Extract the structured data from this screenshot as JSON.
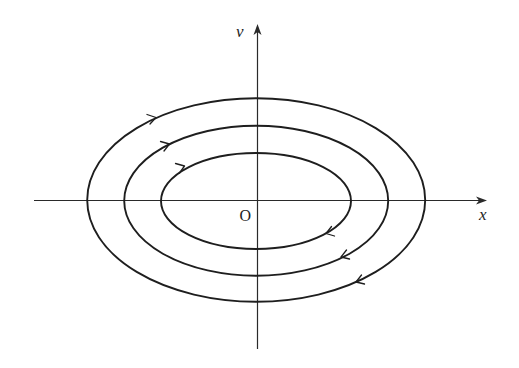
{
  "figure": {
    "type": "phase-portrait",
    "axes": {
      "horizontal": {
        "label": "x",
        "from": [
          34,
          200
        ],
        "to": [
          487,
          200
        ]
      },
      "vertical": {
        "label": "v",
        "from": [
          257,
          349
        ],
        "to": [
          257,
          24
        ]
      }
    },
    "origin_label": "O",
    "trajectory_direction": "clockwise",
    "colors": {
      "stroke": "#1e1e1e",
      "background": "#ffffff"
    },
    "trajectories": [
      {
        "name": "inner",
        "cx": 256,
        "cy": 201,
        "rx": 95,
        "ry": 48,
        "arrows": [
          {
            "x": 183,
            "y": 166,
            "dir": "up-right"
          },
          {
            "x": 327,
            "y": 233,
            "dir": "down-left"
          }
        ]
      },
      {
        "name": "middle",
        "cx": 256,
        "cy": 201,
        "rx": 132,
        "ry": 75,
        "arrows": [
          {
            "x": 168,
            "y": 144,
            "dir": "up-right"
          },
          {
            "x": 342,
            "y": 257,
            "dir": "down-left"
          }
        ]
      },
      {
        "name": "outer",
        "cx": 256,
        "cy": 200,
        "rx": 169,
        "ry": 102,
        "arrows": [
          {
            "x": 155,
            "y": 118,
            "dir": "up-right"
          },
          {
            "x": 357,
            "y": 282,
            "dir": "down-left"
          }
        ]
      }
    ]
  }
}
